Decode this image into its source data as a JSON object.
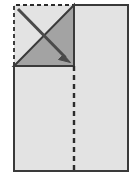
{
  "diagram": {
    "canvas": {
      "width": 133,
      "height": 188
    },
    "colors": {
      "background": "#ffffff",
      "paper_fill": "#e3e3e3",
      "flap_fill": "#a3a3a3",
      "outline": "#3a3a3a",
      "fold_line": "#2b2b2b",
      "arrow": "#4a4a4a"
    },
    "shapes": {
      "sheet": {
        "label": "paper sheet",
        "x": 14,
        "y": 5,
        "width": 114,
        "height": 166,
        "fill": "#e3e3e3",
        "stroke": "#3a3a3a",
        "stroke_width": 2
      },
      "folded_corner_region": {
        "label": "folded corner square",
        "x": 14,
        "y": 5,
        "width": 60,
        "height": 61,
        "dashed_edges": "top, left",
        "note": "region vacated by the fold, shown with dashed outline"
      },
      "flap_triangle": {
        "label": "folded flap triangle",
        "points": "74,5 74,66 14,66",
        "fill": "#a3a3a3",
        "stroke": "#3a3a3a",
        "stroke_width": 2
      },
      "vertical_fold_line": {
        "label": "vertical fold crease",
        "x": 74,
        "y1": 66,
        "y2": 171,
        "style": "dashed",
        "dash_pattern": "5 4",
        "stroke_width": 2.4
      },
      "horizontal_flap_edge": {
        "label": "flap bottom edge",
        "x1": 14,
        "x2": 74,
        "y": 66,
        "style": "solid"
      },
      "fold_arrow": {
        "label": "fold direction arrow",
        "from_x": 18,
        "from_y": 9,
        "to_x": 70,
        "to_y": 62,
        "stroke_width": 3,
        "head_length": 11,
        "head_width": 9,
        "direction": "down-right"
      }
    },
    "dash_patterns": {
      "outline_dashes": "4 3",
      "crease_dashes": "5 4"
    }
  }
}
